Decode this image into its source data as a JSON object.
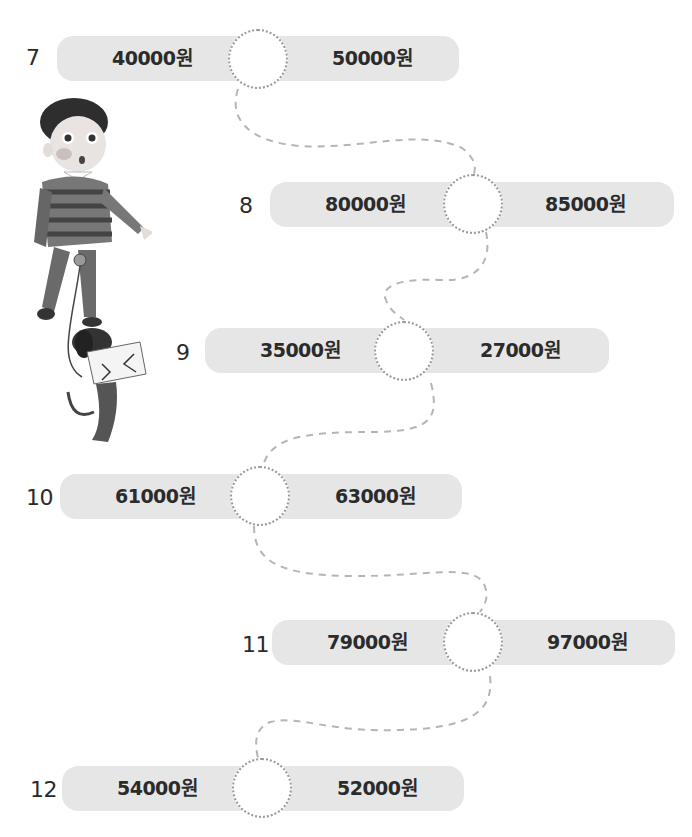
{
  "worksheet": {
    "unit": "원",
    "answer_placeholder": "",
    "problems": [
      {
        "number": "7",
        "left": "40000원",
        "right": "50000원"
      },
      {
        "number": "8",
        "left": "80000원",
        "right": "85000원"
      },
      {
        "number": "9",
        "left": "35000원",
        "right": "27000원"
      },
      {
        "number": "10",
        "left": "61000원",
        "right": "63000원"
      },
      {
        "number": "11",
        "left": "79000원",
        "right": "97000원"
      },
      {
        "number": "12",
        "left": "54000원",
        "right": "52000원"
      }
    ]
  },
  "illustration": {
    "subject": "boy-walking-dog-with-envelope"
  },
  "colors": {
    "bar": "#e6e6e6",
    "circle_border": "#9a9a9a",
    "text": "#2b2b2b",
    "path": "#b5b5b5"
  }
}
